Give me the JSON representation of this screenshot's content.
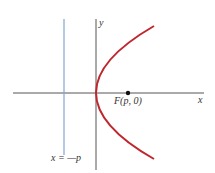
{
  "diagram": {
    "labels": {
      "y_axis": "y",
      "x_axis": "x",
      "focus": "F(p, 0)",
      "directrix": "x = —p"
    },
    "colors": {
      "axes": "#555555",
      "directrix": "#7fa7d0",
      "parabola": "#c0272d",
      "focus_point": "#111111"
    }
  }
}
